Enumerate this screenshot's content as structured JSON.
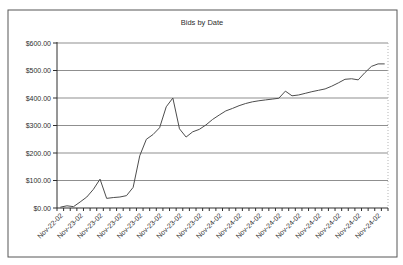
{
  "page": {
    "background": "#ffffff"
  },
  "frame": {
    "border_color": "#575757"
  },
  "chart_data": {
    "type": "line",
    "title": "Bids by Date",
    "xlabel": "",
    "ylabel": "",
    "ylim": [
      0,
      600
    ],
    "y_tick_step": 100,
    "y_tick_labels": [
      "$600.00",
      "$500.00",
      "$400.00",
      "$300.00",
      "$200.00",
      "$100.00",
      "$0.00"
    ],
    "x_tick_labels": [
      "Nov-22-02",
      "Nov-23-02",
      "Nov-23-02",
      "Nov-23-02",
      "Nov-23-02",
      "Nov-23-02",
      "Nov-23-02",
      "Nov-23-02",
      "Nov-24-02",
      "Nov-24-02",
      "Nov-24-02",
      "Nov-24-02",
      "Nov-24-02",
      "Nov-24-02",
      "Nov-24-02",
      "Nov-24-02",
      "Nov-24-02"
    ],
    "x_label_every_n_points": 3,
    "num_points": 50,
    "values": [
      3,
      8,
      5,
      22,
      40,
      68,
      105,
      35,
      38,
      40,
      45,
      75,
      190,
      250,
      267,
      292,
      368,
      400,
      288,
      258,
      277,
      286,
      302,
      322,
      338,
      353,
      362,
      372,
      380,
      386,
      390,
      393,
      396,
      399,
      425,
      408,
      411,
      417,
      423,
      428,
      433,
      443,
      455,
      468,
      470,
      466,
      492,
      515,
      524,
      524
    ],
    "grid": "horizontal",
    "legend_position": "none",
    "colors": {
      "line": "#4d4d4d",
      "gridline": "#8f8f8f",
      "axis": "#2e2e2e",
      "text": "#2e2e2e",
      "plot_right_border": "#b5b5b5"
    }
  }
}
